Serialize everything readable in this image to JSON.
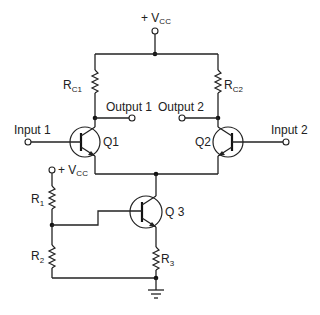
{
  "diagram": {
    "supply": {
      "label_prefix": "+ V",
      "label_sub": "CC"
    },
    "bias_supply": {
      "label_prefix": "+ V",
      "label_sub": "CC"
    },
    "resistors": [
      {
        "id": "RC1",
        "label": "R",
        "sub": "C1"
      },
      {
        "id": "RC2",
        "label": "R",
        "sub": "C2"
      },
      {
        "id": "R1",
        "label": "R",
        "sub": "1"
      },
      {
        "id": "R2",
        "label": "R",
        "sub": "2"
      },
      {
        "id": "R3",
        "label": "R",
        "sub": "3"
      }
    ],
    "transistors": [
      {
        "id": "Q1",
        "label": "Q1",
        "type": "NPN"
      },
      {
        "id": "Q2",
        "label": "Q2",
        "type": "NPN"
      },
      {
        "id": "Q3",
        "label": "Q 3",
        "type": "NPN"
      }
    ],
    "terminals": {
      "input1": "Input 1",
      "input2": "Input 2",
      "output1": "Output 1",
      "output2": "Output 2"
    },
    "ground": "ground",
    "colors": {
      "line": "#222222",
      "background": "#ffffff"
    }
  }
}
